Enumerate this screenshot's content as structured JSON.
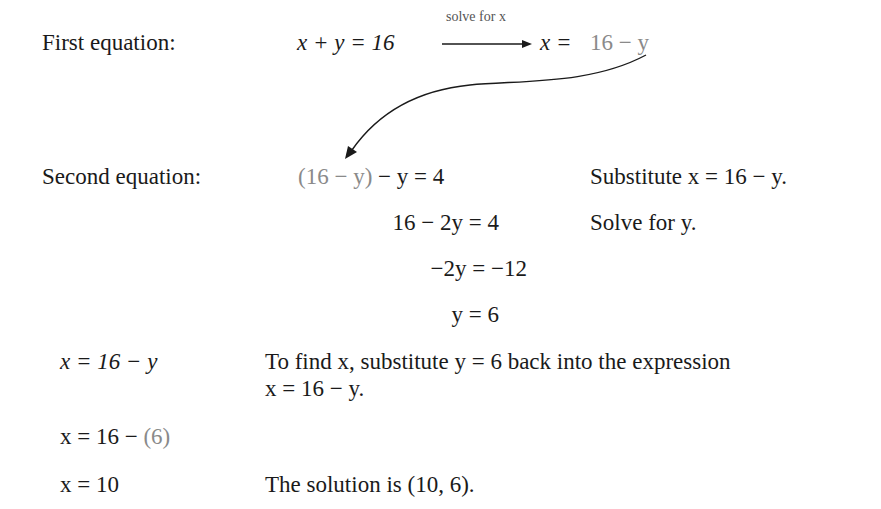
{
  "step1": {
    "label": "First equation:",
    "equation_lhs": "x + y = 16",
    "arrow_label": "solve for x",
    "result_lhs": "x =",
    "result_rhs": "16 − y"
  },
  "step2": {
    "label": "Second equation:",
    "lines": [
      {
        "expr_grey": "(16 − y)",
        "expr": " − y = 4",
        "note": "Substitute x = 16 − y."
      },
      {
        "expr": "16 − 2y = 4",
        "note": "Solve for y."
      },
      {
        "expr": "−2y = −12",
        "note": ""
      },
      {
        "expr": "y = 6",
        "note": ""
      }
    ]
  },
  "back_substitution": {
    "rows": [
      {
        "expr": "x = 16 − y",
        "note_line1": "To find x, substitute y = 6 back into the expression",
        "note_line2": "x = 16 − y."
      },
      {
        "expr": "x = 16 − ",
        "expr_grey": "(6)"
      },
      {
        "expr": "x = 10",
        "note_line1": "The solution is (10, 6)."
      }
    ]
  },
  "colors": {
    "text": "#1a1a1a",
    "highlight_grey": "#8a8a8a"
  }
}
